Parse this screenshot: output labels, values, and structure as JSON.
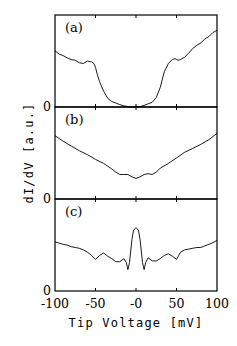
{
  "chart_data": {
    "type": "line",
    "title": "",
    "xlabel": "Tip Voltage [mV]",
    "ylabel": "dI/dV [a.u.]",
    "xlim": [
      -100,
      100
    ],
    "xticks": [
      -100,
      -50,
      0,
      50,
      100
    ],
    "xtick_labels": [
      "-100",
      "-50",
      "-0",
      "50",
      "100"
    ],
    "grid": false,
    "legend": "none",
    "panels": [
      {
        "label": "(a)",
        "zero_label": "0",
        "ylim": [
          0,
          1
        ],
        "x": [
          -100,
          -95,
          -90,
          -85,
          -80,
          -75,
          -70,
          -65,
          -60,
          -55,
          -52,
          -50,
          -48,
          -45,
          -40,
          -35,
          -30,
          -25,
          -20,
          -15,
          -10,
          -5,
          0,
          5,
          10,
          15,
          20,
          25,
          30,
          35,
          40,
          45,
          48,
          50,
          52,
          55,
          60,
          65,
          70,
          75,
          80,
          85,
          90,
          95,
          100
        ],
        "y": [
          0.71,
          0.67,
          0.65,
          0.62,
          0.6,
          0.59,
          0.56,
          0.55,
          0.58,
          0.57,
          0.55,
          0.5,
          0.42,
          0.32,
          0.2,
          0.11,
          0.07,
          0.05,
          0.03,
          0.015,
          0.005,
          0.0,
          0.0,
          0.005,
          0.02,
          0.04,
          0.06,
          0.12,
          0.25,
          0.45,
          0.55,
          0.6,
          0.61,
          0.6,
          0.59,
          0.6,
          0.63,
          0.68,
          0.74,
          0.78,
          0.81,
          0.86,
          0.89,
          0.94,
          0.97
        ]
      },
      {
        "label": "(b)",
        "zero_label": "0",
        "ylim": [
          0,
          1
        ],
        "x": [
          -100,
          -90,
          -80,
          -70,
          -60,
          -50,
          -40,
          -30,
          -25,
          -20,
          -15,
          -10,
          -5,
          0,
          5,
          10,
          15,
          20,
          25,
          30,
          40,
          50,
          60,
          70,
          80,
          90,
          100
        ],
        "y": [
          0.8,
          0.73,
          0.67,
          0.61,
          0.56,
          0.5,
          0.45,
          0.38,
          0.34,
          0.31,
          0.31,
          0.31,
          0.28,
          0.26,
          0.28,
          0.31,
          0.32,
          0.31,
          0.34,
          0.39,
          0.45,
          0.52,
          0.59,
          0.64,
          0.69,
          0.75,
          0.83
        ]
      },
      {
        "label": "(c)",
        "zero_label": "0",
        "ylim": [
          0,
          1
        ],
        "x": [
          -100,
          -90,
          -85,
          -80,
          -75,
          -70,
          -65,
          -60,
          -55,
          -50,
          -45,
          -40,
          -35,
          -30,
          -25,
          -20,
          -15,
          -12,
          -10,
          -8,
          -5,
          -3,
          0,
          3,
          5,
          8,
          10,
          12,
          15,
          20,
          25,
          30,
          35,
          40,
          45,
          50,
          55,
          60,
          65,
          70,
          75,
          80,
          85,
          90,
          95,
          100
        ],
        "y": [
          0.62,
          0.59,
          0.58,
          0.56,
          0.55,
          0.54,
          0.52,
          0.49,
          0.45,
          0.4,
          0.45,
          0.48,
          0.44,
          0.41,
          0.37,
          0.37,
          0.41,
          0.36,
          0.27,
          0.36,
          0.65,
          0.77,
          0.8,
          0.77,
          0.65,
          0.36,
          0.27,
          0.36,
          0.42,
          0.38,
          0.38,
          0.41,
          0.45,
          0.47,
          0.44,
          0.4,
          0.49,
          0.52,
          0.53,
          0.54,
          0.55,
          0.55,
          0.57,
          0.59,
          0.61,
          0.64
        ]
      }
    ]
  }
}
